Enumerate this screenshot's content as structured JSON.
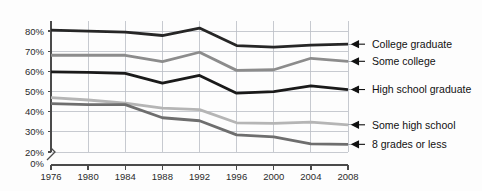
{
  "chart_data": {
    "type": "line",
    "title": "",
    "subtitle": "",
    "xlabel": "",
    "ylabel": "",
    "x": [
      1976,
      1980,
      1984,
      1988,
      1992,
      1996,
      2000,
      2004,
      2008
    ],
    "categories": [
      "1976",
      "1980",
      "1984",
      "1988",
      "1992",
      "1996",
      "2000",
      "2004",
      "2008"
    ],
    "ylim": [
      20,
      85
    ],
    "ytick_values": [
      20,
      30,
      40,
      50,
      60,
      70,
      80
    ],
    "ytick_labels": [
      "20%",
      "30%",
      "40%",
      "50%",
      "60%",
      "70%",
      "80%"
    ],
    "zero_tick_label": "0%",
    "axis_break": true,
    "grid": true,
    "legend_position": "right-inline-arrows",
    "series": [
      {
        "name": "College graduate",
        "color": "#262626",
        "width": 2.8,
        "values": [
          80.5,
          80.0,
          79.5,
          77.8,
          81.5,
          72.8,
          72.0,
          73.0,
          73.5
        ]
      },
      {
        "name": "Some college",
        "color": "#8c8c8c",
        "width": 2.8,
        "values": [
          68.0,
          68.0,
          68.0,
          64.8,
          69.5,
          60.5,
          60.8,
          66.5,
          65.0
        ]
      },
      {
        "name": "High school graduate",
        "color": "#1a1a1a",
        "width": 2.8,
        "values": [
          59.8,
          59.5,
          59.0,
          54.2,
          58.0,
          49.2,
          50.0,
          52.8,
          51.0
        ]
      },
      {
        "name": "Some high school",
        "color": "#b5b5b5",
        "width": 2.8,
        "values": [
          47.0,
          45.8,
          44.2,
          41.8,
          41.0,
          34.5,
          34.2,
          34.8,
          33.5
        ]
      },
      {
        "name": "8 grades or less",
        "color": "#6e6e6e",
        "width": 2.8,
        "values": [
          44.0,
          43.5,
          43.5,
          37.0,
          35.5,
          28.5,
          27.5,
          24.0,
          23.8
        ]
      }
    ]
  },
  "legend": {
    "arrow_glyph": "left-arrow",
    "items": [
      {
        "label": "College graduate"
      },
      {
        "label": "Some college"
      },
      {
        "label": "High school graduate"
      },
      {
        "label": "Some high school"
      },
      {
        "label": "8 grades or less"
      }
    ]
  }
}
